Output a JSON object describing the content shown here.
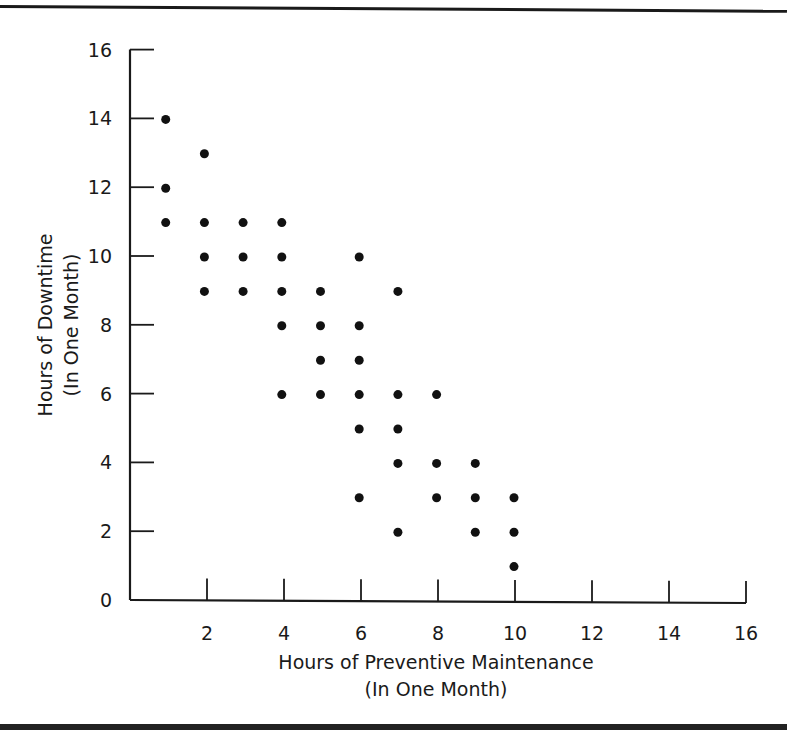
{
  "chart_data": {
    "type": "scatter",
    "title": "",
    "xlabel": "Hours of Preventive Maintenance",
    "xlabel_sub": "(In One Month)",
    "ylabel": "Hours of Downtime",
    "ylabel_sub": "(In One Month)",
    "xlim": [
      0,
      16
    ],
    "ylim": [
      0,
      16
    ],
    "x_ticks": [
      2,
      4,
      6,
      8,
      10,
      12,
      14,
      16
    ],
    "y_ticks": [
      0,
      2,
      4,
      6,
      8,
      10,
      12,
      14,
      16
    ],
    "grid": false,
    "legend": null,
    "points": [
      {
        "x": 1,
        "y": 14
      },
      {
        "x": 1,
        "y": 12
      },
      {
        "x": 1,
        "y": 11
      },
      {
        "x": 2,
        "y": 13
      },
      {
        "x": 2,
        "y": 11
      },
      {
        "x": 2,
        "y": 10
      },
      {
        "x": 2,
        "y": 9
      },
      {
        "x": 3,
        "y": 11
      },
      {
        "x": 3,
        "y": 10
      },
      {
        "x": 3,
        "y": 9
      },
      {
        "x": 4,
        "y": 11
      },
      {
        "x": 4,
        "y": 10
      },
      {
        "x": 4,
        "y": 9
      },
      {
        "x": 4,
        "y": 8
      },
      {
        "x": 4,
        "y": 6
      },
      {
        "x": 5,
        "y": 9
      },
      {
        "x": 5,
        "y": 8
      },
      {
        "x": 5,
        "y": 7
      },
      {
        "x": 5,
        "y": 6
      },
      {
        "x": 6,
        "y": 10
      },
      {
        "x": 6,
        "y": 8
      },
      {
        "x": 6,
        "y": 7
      },
      {
        "x": 6,
        "y": 6
      },
      {
        "x": 6,
        "y": 5
      },
      {
        "x": 6,
        "y": 3
      },
      {
        "x": 7,
        "y": 9
      },
      {
        "x": 7,
        "y": 6
      },
      {
        "x": 7,
        "y": 5
      },
      {
        "x": 7,
        "y": 4
      },
      {
        "x": 7,
        "y": 2
      },
      {
        "x": 8,
        "y": 6
      },
      {
        "x": 8,
        "y": 4
      },
      {
        "x": 8,
        "y": 3
      },
      {
        "x": 9,
        "y": 4
      },
      {
        "x": 9,
        "y": 3
      },
      {
        "x": 9,
        "y": 2
      },
      {
        "x": 10,
        "y": 3
      },
      {
        "x": 10,
        "y": 2
      },
      {
        "x": 10,
        "y": 1
      }
    ],
    "marker_color": "#111111"
  }
}
